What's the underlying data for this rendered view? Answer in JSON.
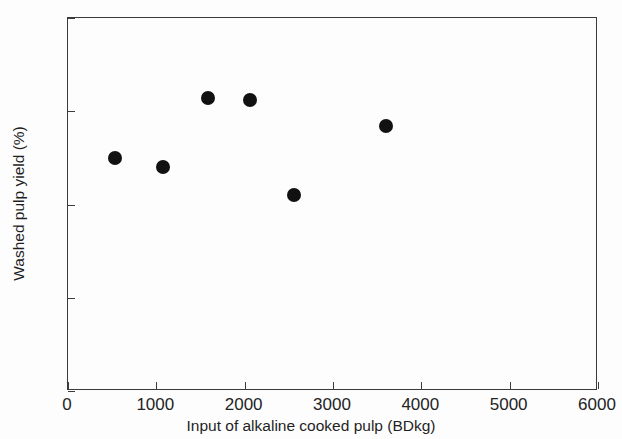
{
  "chart_data": {
    "type": "scatter",
    "title": "",
    "xlabel": "Input of alkaline cooked pulp (BDkg)",
    "ylabel": "Washed pulp yield (%)",
    "xlim": [
      0,
      6000
    ],
    "ylim": [
      80,
      100
    ],
    "xticks": [
      0,
      1000,
      2000,
      3000,
      4000,
      5000,
      6000
    ],
    "yticks": [
      80,
      85,
      90,
      95,
      100
    ],
    "xtick_labels": [
      "0",
      "1000",
      "2000",
      "3000",
      "4000",
      "5000",
      "6000"
    ],
    "ytick_labels": [
      "80",
      "85",
      "90",
      "95",
      "100"
    ],
    "grid": false,
    "legend": null,
    "marker": {
      "shape": "circle",
      "color": "#111111",
      "size_px": 14,
      "filled": true
    },
    "points": [
      {
        "x": 530,
        "y": 92.5
      },
      {
        "x": 1075,
        "y": 92.0
      },
      {
        "x": 1580,
        "y": 95.7
      },
      {
        "x": 2060,
        "y": 95.6
      },
      {
        "x": 2555,
        "y": 90.5
      },
      {
        "x": 3595,
        "y": 94.2
      }
    ]
  },
  "figure": {
    "background_color": "#fdfdfe",
    "axis_color": "#3b3b3b",
    "text_color": "#232323"
  }
}
